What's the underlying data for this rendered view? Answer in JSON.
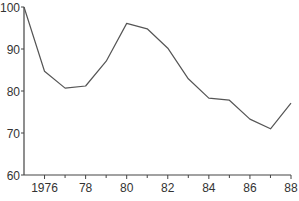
{
  "chart_data": {
    "type": "line",
    "title": "",
    "xlabel": "",
    "ylabel": "",
    "x": [
      1975,
      1976,
      1977,
      1978,
      1979,
      1980,
      1981,
      1982,
      1983,
      1984,
      1985,
      1986,
      1987,
      1988
    ],
    "series": [
      {
        "name": "",
        "values": [
          100,
          84.7,
          80.7,
          81.2,
          87.1,
          96.1,
          94.8,
          90.2,
          82.9,
          78.3,
          77.8,
          73.3,
          71.0,
          77.1
        ]
      }
    ],
    "ylim": [
      60,
      100
    ],
    "xlim": [
      1975,
      1988
    ],
    "yticks": [
      60,
      70,
      80,
      90,
      100
    ],
    "ytick_labels": [
      "60",
      "70",
      "80",
      "90",
      "100"
    ],
    "xticks": [
      1976,
      1978,
      1980,
      1982,
      1984,
      1986,
      1988
    ],
    "xtick_labels": [
      "1976",
      "78",
      "80",
      "82",
      "84",
      "86",
      "88"
    ],
    "minor_xticks": [
      1977,
      1979,
      1981,
      1983,
      1985,
      1987
    ],
    "grid": false,
    "legend": null,
    "line_color": "#555555",
    "axis_color": "#444444"
  }
}
